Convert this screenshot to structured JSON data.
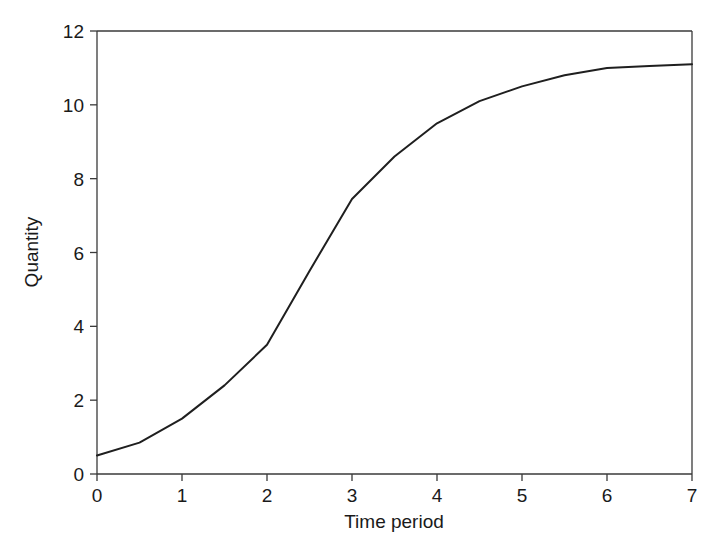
{
  "chart_data": {
    "type": "line",
    "title": "",
    "subtitle": "",
    "xlabel": "Time period",
    "ylabel": "Quantity",
    "xlim": [
      0,
      7
    ],
    "ylim": [
      0,
      12
    ],
    "xticks": [
      "0",
      "1",
      "2",
      "3",
      "4",
      "5",
      "6",
      "7"
    ],
    "xtick_values": [
      0,
      1,
      2,
      3,
      4,
      5,
      6,
      7
    ],
    "yticks": [
      "0",
      "2",
      "4",
      "6",
      "8",
      "10",
      "12"
    ],
    "ytick_values": [
      0,
      2,
      4,
      6,
      8,
      10,
      12
    ],
    "grid": false,
    "legend": null,
    "legend_position": "none",
    "line_color": "#1f1f1f",
    "axis_color": "#3a3a3a",
    "background_color": "#ffffff",
    "series": [
      {
        "name": "Quantity",
        "x": [
          0,
          0.5,
          1,
          1.5,
          2,
          2.5,
          3,
          3.5,
          4,
          4.5,
          5,
          5.5,
          6,
          6.5,
          7
        ],
        "values": [
          0.5,
          0.85,
          1.5,
          2.4,
          3.5,
          5.5,
          7.45,
          8.6,
          9.5,
          10.1,
          10.5,
          10.8,
          11.0,
          11.05,
          11.1
        ]
      }
    ],
    "annotations": []
  }
}
